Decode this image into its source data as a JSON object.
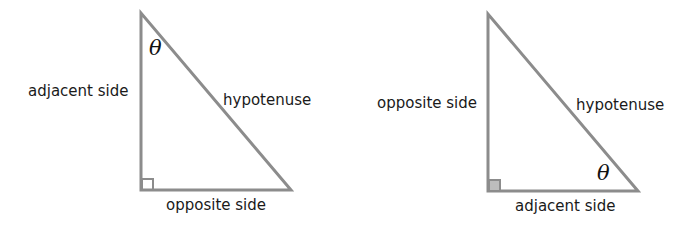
{
  "colors": {
    "stroke": "#8c8c8c",
    "text": "#1a1a1a",
    "background": "#ffffff"
  },
  "triangles": [
    {
      "id": "left",
      "angle_symbol": "θ",
      "angle_position": "top vertex",
      "labels": {
        "vertical": "adjacent side",
        "horizontal": "opposite side",
        "hypotenuse": "hypotenuse"
      },
      "right_angle_marker": "bottom-left"
    },
    {
      "id": "right",
      "angle_symbol": "θ",
      "angle_position": "bottom-right vertex",
      "labels": {
        "vertical": "opposite side",
        "horizontal": "adjacent side",
        "hypotenuse": "hypotenuse"
      },
      "right_angle_marker": "bottom-left"
    }
  ]
}
